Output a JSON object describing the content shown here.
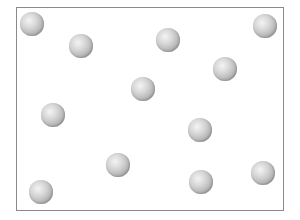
{
  "diagram": {
    "container": {
      "border_color": "#8a8a8a",
      "fill_color": "#ffffff"
    },
    "particle_color": "#b0b0b0",
    "particle_radius": 12,
    "particle_count": 12,
    "particles": [
      {
        "x": 32,
        "y": 24
      },
      {
        "x": 81,
        "y": 46
      },
      {
        "x": 168,
        "y": 40
      },
      {
        "x": 265,
        "y": 26
      },
      {
        "x": 225,
        "y": 69
      },
      {
        "x": 143,
        "y": 89
      },
      {
        "x": 53,
        "y": 115
      },
      {
        "x": 200,
        "y": 130
      },
      {
        "x": 118,
        "y": 165
      },
      {
        "x": 263,
        "y": 173
      },
      {
        "x": 201,
        "y": 182
      },
      {
        "x": 41,
        "y": 192
      }
    ]
  }
}
